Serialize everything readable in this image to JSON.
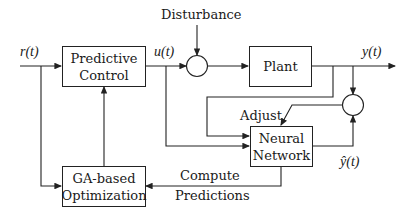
{
  "diagram": {
    "type": "block-diagram",
    "blocks": {
      "predictive_control": {
        "line1": "Predictive",
        "line2": "Control"
      },
      "plant": {
        "line1": "Plant"
      },
      "neural_network": {
        "line1": "Neural",
        "line2": "Network"
      },
      "ga_optimization": {
        "line1": "GA-based",
        "line2": "Optimization"
      }
    },
    "signals": {
      "reference": "r(t)",
      "control": "u(t)",
      "output": "y(t)",
      "predicted_output": "ŷ(t)",
      "disturbance": "Disturbance",
      "adjust": "Adjust",
      "compute_line1": "Compute",
      "compute_line2": "Predictions"
    },
    "summing_junctions": 2,
    "colors": {
      "stroke": "#222222",
      "background": "#ffffff"
    }
  }
}
